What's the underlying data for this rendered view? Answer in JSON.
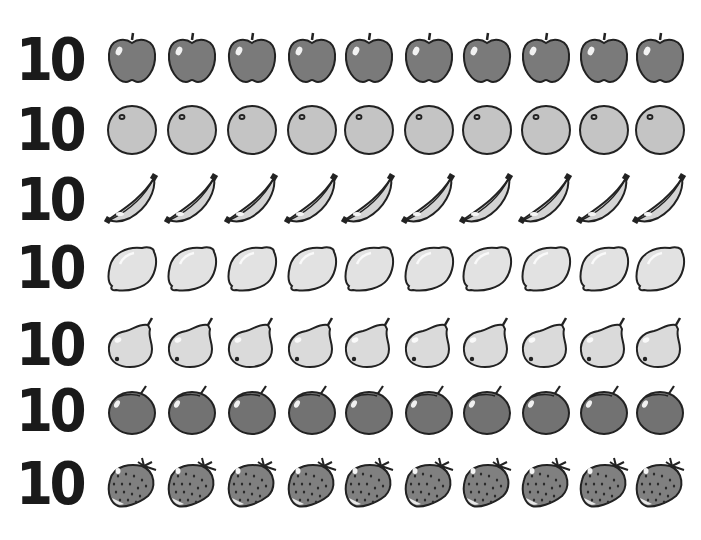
{
  "rows": [
    {
      "count": "10",
      "fruit": "apple",
      "items": 10,
      "fill": "#7a7a7a"
    },
    {
      "count": "10",
      "fruit": "orange",
      "items": 10,
      "fill": "#c4c4c4"
    },
    {
      "count": "10",
      "fruit": "banana",
      "items": 10,
      "fill": "#d4d4d4"
    },
    {
      "count": "10",
      "fruit": "lemon",
      "items": 10,
      "fill": "#e2e2e2"
    },
    {
      "count": "10",
      "fruit": "pear",
      "items": 10,
      "fill": "#dadada"
    },
    {
      "count": "10",
      "fruit": "plum",
      "items": 10,
      "fill": "#727272"
    },
    {
      "count": "10",
      "fruit": "strawberry",
      "items": 10,
      "fill": "#808080"
    }
  ],
  "stroke": "#222222",
  "background": "#ffffff"
}
